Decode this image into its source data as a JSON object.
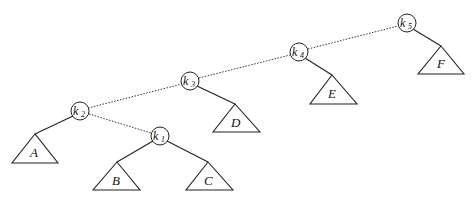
{
  "diagram": {
    "type": "binary-search-tree",
    "nodes": [
      {
        "id": "k1",
        "label": "k",
        "sub": "1",
        "cx": 160,
        "cy": 136
      },
      {
        "id": "k2",
        "label": "k",
        "sub": "2",
        "cx": 80,
        "cy": 111
      },
      {
        "id": "k3",
        "label": "k",
        "sub": "3",
        "cx": 190,
        "cy": 81
      },
      {
        "id": "k4",
        "label": "k",
        "sub": "4",
        "cx": 299,
        "cy": 52
      },
      {
        "id": "k5",
        "label": "k",
        "sub": "5",
        "cx": 407,
        "cy": 23
      }
    ],
    "subtrees": [
      {
        "id": "A",
        "label": "A",
        "apex": [
          35,
          134
        ],
        "left": [
          12,
          163
        ],
        "right": [
          58,
          163
        ]
      },
      {
        "id": "B",
        "label": "B",
        "apex": [
          117,
          162
        ],
        "left": [
          93,
          190
        ],
        "right": [
          140,
          190
        ]
      },
      {
        "id": "C",
        "label": "C",
        "apex": [
          208,
          162
        ],
        "left": [
          186,
          190
        ],
        "right": [
          233,
          190
        ]
      },
      {
        "id": "D",
        "label": "D",
        "apex": [
          235,
          104
        ],
        "left": [
          213,
          132
        ],
        "right": [
          260,
          132
        ]
      },
      {
        "id": "E",
        "label": "E",
        "apex": [
          332,
          75
        ],
        "left": [
          310,
          104
        ],
        "right": [
          357,
          104
        ]
      },
      {
        "id": "F",
        "label": "F",
        "apex": [
          441,
          46
        ],
        "left": [
          418,
          74
        ],
        "right": [
          464,
          74
        ]
      }
    ],
    "solid_edges": [
      {
        "from": "k2",
        "to": "A"
      },
      {
        "from": "k1",
        "to": "B"
      },
      {
        "from": "k1",
        "to": "C"
      },
      {
        "from": "k3",
        "to": "D"
      },
      {
        "from": "k4",
        "to": "E"
      },
      {
        "from": "k5",
        "to": "F"
      }
    ],
    "dotted_edges": [
      {
        "from": "k2",
        "to": "k3"
      },
      {
        "from": "k3",
        "to": "k4"
      },
      {
        "from": "k4",
        "to": "k5"
      },
      {
        "from": "k2",
        "to": "k1"
      }
    ],
    "labels": {
      "k1": "k",
      "k1_sub": "1",
      "k2": "k",
      "k2_sub": "2",
      "k3": "k",
      "k3_sub": "3",
      "k4": "k",
      "k4_sub": "4",
      "k5": "k",
      "k5_sub": "5",
      "A": "A",
      "B": "B",
      "C": "C",
      "D": "D",
      "E": "E",
      "F": "F"
    }
  }
}
